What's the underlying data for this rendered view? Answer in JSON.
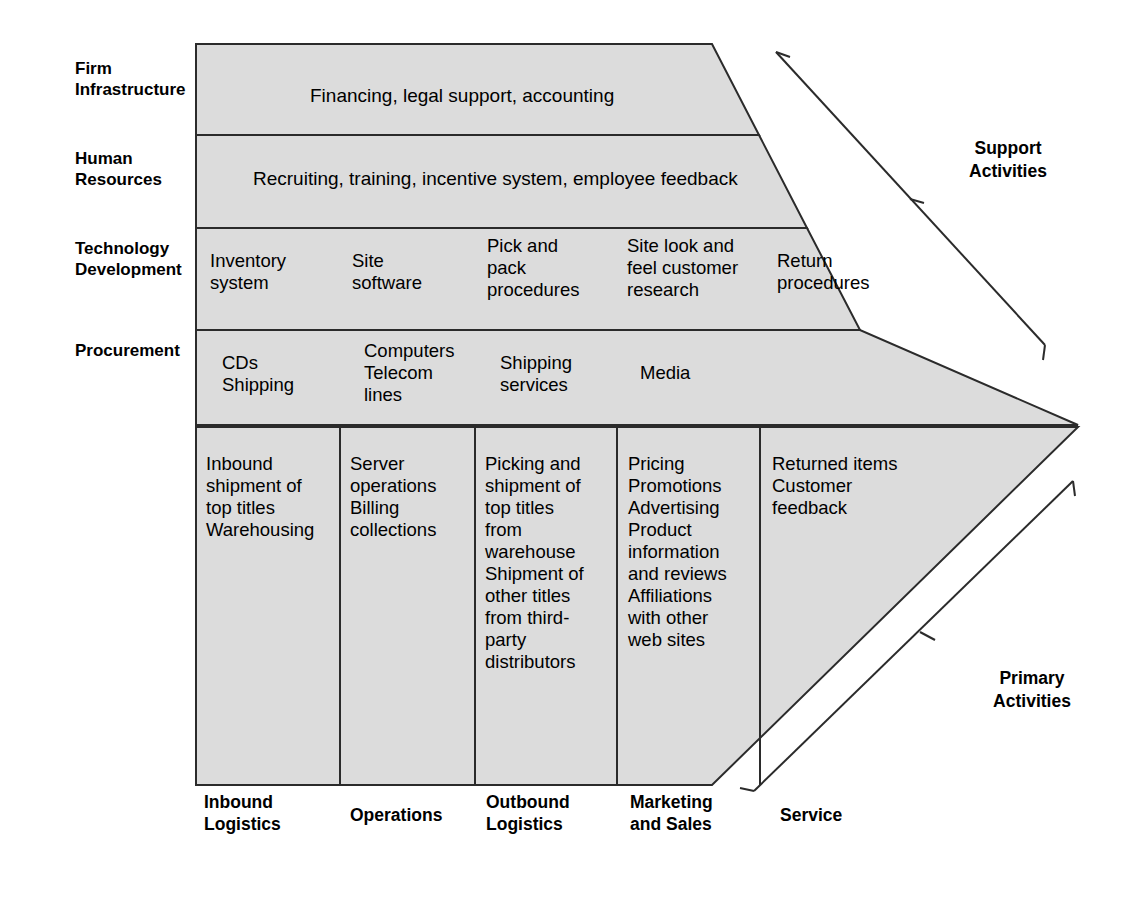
{
  "diagram": {
    "fill_color": "#dcdcdc",
    "line_color": "#2b2b2b",
    "support_rows": [
      {
        "label": "Firm\nInfrastructure",
        "span": "full",
        "content": "Financing, legal support, accounting",
        "cells": []
      },
      {
        "label": "Human\nResources",
        "span": "full",
        "content": "Recruiting, training, incentive system, employee feedback",
        "cells": []
      },
      {
        "label": "Technology\nDevelopment",
        "span": "columns",
        "content": "",
        "cells": [
          "Inventory\nsystem",
          "Site\nsoftware",
          "Pick and\npack\nprocedures",
          "Site look and\nfeel customer\nresearch",
          "Return\nprocedures"
        ]
      },
      {
        "label": "Procurement",
        "span": "columns",
        "content": "",
        "cells": [
          "CDs\nShipping",
          "Computers\nTelecom\nlines",
          "Shipping\nservices",
          "Media",
          ""
        ]
      }
    ],
    "primary_row": {
      "cells": [
        "Inbound\nshipment of\ntop titles\nWarehousing",
        "Server\noperations\nBilling\ncollections",
        "Picking and\nshipment of\ntop titles\nfrom\nwarehouse\nShipment of\nother titles\nfrom third-\nparty\ndistributors",
        "Pricing\nPromotions\nAdvertising\nProduct\ninformation\nand reviews\nAffiliations\nwith other\nweb sites",
        "Returned items\nCustomer\nfeedback"
      ]
    },
    "column_labels": [
      "Inbound\nLogistics",
      "Operations",
      "Outbound\nLogistics",
      "Marketing\nand Sales",
      "Service"
    ],
    "side_labels": [
      "Support\nActivities",
      "Primary\nActivities"
    ]
  }
}
